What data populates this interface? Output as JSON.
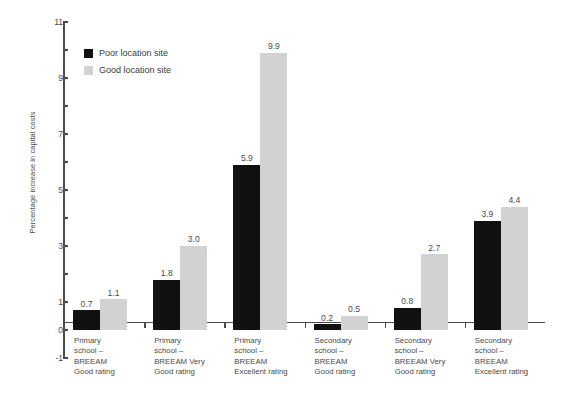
{
  "chart_data": {
    "type": "bar",
    "title": "",
    "xlabel": "",
    "ylabel": "Percentage increase in capital costs",
    "ylim": [
      -1,
      11
    ],
    "ytick_labels": [
      "11",
      "9",
      "7",
      "5",
      "3",
      "1",
      "0",
      "-1"
    ],
    "ytick_values": [
      11,
      9,
      7,
      5,
      3,
      1,
      0,
      -1
    ],
    "grid": false,
    "legend_position": "top-left-inside",
    "categories": [
      "Primary\nschool –\nBREEAM\nGood rating",
      "Primary\nschool –\nBREEAM Very\nGood rating",
      "Primary\nschool –\nBREEAM\nExcellent rating",
      "Secondary\nschool –\nBREEAM\nGood rating",
      "Secondary\nschool –\nBREEAM Very\nGood rating",
      "Secondary\nschool –\nBREEAM\nExcellent rating"
    ],
    "series": [
      {
        "name": "Poor location site",
        "color": "#111111",
        "values": [
          0.7,
          1.8,
          5.9,
          0.2,
          0.8,
          3.9
        ],
        "labels": [
          "0.7",
          "1.8",
          "5.9",
          "0.2",
          "0.8",
          "3.9"
        ]
      },
      {
        "name": "Good location site",
        "color": "#d2d2d2",
        "values": [
          1.1,
          3.0,
          9.9,
          0.5,
          2.7,
          4.4
        ],
        "labels": [
          "1.1",
          "3.0",
          "9.9",
          "0.5",
          "2.7",
          "4.4"
        ]
      }
    ]
  }
}
